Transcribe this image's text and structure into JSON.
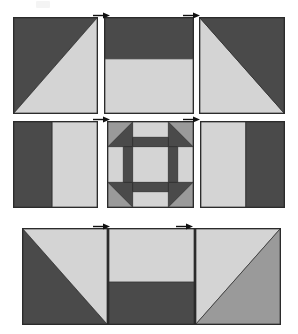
{
  "diagram": {
    "width": 298,
    "height": 334,
    "colors": {
      "dark": "#4a4a4a",
      "light": "#d4d4d4",
      "medium": "#9a9a9a",
      "outline": "#2b2b2b",
      "background": "#ffffff"
    },
    "faint_mark": {
      "x": 36,
      "y": 1,
      "w": 14,
      "h": 7,
      "color": "#f4f4f4"
    },
    "rows": [
      {
        "name": "row-1",
        "y": 17,
        "height": 97,
        "blocks": [
          {
            "name": "block-r1c1-half-square-triangle",
            "x": 13,
            "y": 17,
            "w": 85,
            "h": 97,
            "pattern": "hst-dark-upper-left",
            "pieces": [
              {
                "name": "dark-triangle",
                "fill": "dark",
                "points": "0,0 100,0 0,100"
              },
              {
                "name": "light-triangle",
                "fill": "light",
                "points": "100,0 100,100 0,100"
              }
            ]
          },
          {
            "name": "block-r1c2-half-rectangle",
            "x": 104,
            "y": 17,
            "w": 90,
            "h": 97,
            "pattern": "horizontal-split-dark-top",
            "pieces": [
              {
                "name": "dark-band-top",
                "fill": "dark",
                "points": "0,0 100,0 100,43 0,43"
              },
              {
                "name": "light-band-bottom",
                "fill": "light",
                "points": "0,43 100,43 100,100 0,100"
              }
            ]
          },
          {
            "name": "block-r1c3-half-square-triangle",
            "x": 199,
            "y": 17,
            "w": 86,
            "h": 97,
            "pattern": "hst-dark-upper-right",
            "pieces": [
              {
                "name": "light-triangle",
                "fill": "light",
                "points": "0,0 0,100 100,100"
              },
              {
                "name": "dark-triangle",
                "fill": "dark",
                "points": "0,0 100,0 100,100"
              }
            ]
          }
        ],
        "arrows": [
          {
            "name": "seam-arrow-r1-a",
            "x": 93,
            "y": 12,
            "direction": "right"
          },
          {
            "name": "seam-arrow-r1-b",
            "x": 183,
            "y": 12,
            "direction": "right"
          }
        ]
      },
      {
        "name": "row-2",
        "y": 121,
        "height": 87,
        "blocks": [
          {
            "name": "block-r2c1-two-bar",
            "x": 13,
            "y": 121,
            "w": 85,
            "h": 87,
            "pattern": "vertical-split-dark-left",
            "pieces": [
              {
                "name": "dark-bar-left",
                "fill": "dark",
                "points": "0,0 46,0 46,100 0,100"
              },
              {
                "name": "light-bar-right",
                "fill": "light",
                "points": "46,0 100,0 100,100 46,100"
              }
            ]
          },
          {
            "name": "block-r2c2-churn-dash-center",
            "x": 107,
            "y": 121,
            "w": 87,
            "h": 87,
            "pattern": "churn-dash",
            "pieces": [
              {
                "name": "background",
                "fill": "medium",
                "points": "0,0 100,0 100,100 0,100"
              },
              {
                "name": "corner-triangle-top-left",
                "fill": "dark",
                "points": "0,29 29,0 29,29"
              },
              {
                "name": "corner-triangle-top-right",
                "fill": "dark",
                "points": "71,0 100,29 71,29"
              },
              {
                "name": "corner-triangle-bottom-left",
                "fill": "dark",
                "points": "0,71 29,71 29,100"
              },
              {
                "name": "corner-triangle-bottom-right",
                "fill": "dark",
                "points": "71,71 100,71 71,100"
              },
              {
                "name": "bar-top-dark",
                "fill": "dark",
                "points": "29,18 71,18 71,29 29,29"
              },
              {
                "name": "bar-top-light",
                "fill": "light",
                "points": "29,0 71,0 71,18 29,18"
              },
              {
                "name": "bar-bottom-dark",
                "fill": "dark",
                "points": "29,71 71,71 71,82 29,82"
              },
              {
                "name": "bar-bottom-light",
                "fill": "light",
                "points": "29,82 71,82 71,100 29,100"
              },
              {
                "name": "bar-left-dark",
                "fill": "dark",
                "points": "18,29 29,29 29,71 18,71"
              },
              {
                "name": "bar-left-light",
                "fill": "light",
                "points": "0,29 18,29 18,71 0,71"
              },
              {
                "name": "bar-right-dark",
                "fill": "dark",
                "points": "71,29 82,29 82,71 71,71"
              },
              {
                "name": "bar-right-light",
                "fill": "light",
                "points": "82,29 100,29 100,71 82,71"
              },
              {
                "name": "center-square",
                "fill": "light",
                "points": "29,29 71,29 71,71 29,71"
              }
            ]
          },
          {
            "name": "block-r2c3-two-bar",
            "x": 200,
            "y": 121,
            "w": 85,
            "h": 87,
            "pattern": "vertical-split-light-left",
            "pieces": [
              {
                "name": "light-bar-left",
                "fill": "light",
                "points": "0,0 54,0 54,100 0,100"
              },
              {
                "name": "dark-bar-right",
                "fill": "dark",
                "points": "54,0 100,0 100,100 54,100"
              }
            ]
          }
        ],
        "arrows": [
          {
            "name": "seam-arrow-r2-a",
            "x": 93,
            "y": 116,
            "direction": "right"
          },
          {
            "name": "seam-arrow-r2-b",
            "x": 183,
            "y": 116,
            "direction": "right"
          }
        ]
      },
      {
        "name": "row-3",
        "y": 228,
        "height": 97,
        "blocks": [
          {
            "name": "block-r3c1-half-square-triangle",
            "x": 22,
            "y": 228,
            "w": 86,
            "h": 97,
            "pattern": "hst-light-upper-right",
            "pieces": [
              {
                "name": "dark-triangle",
                "fill": "dark",
                "points": "0,0 0,100 100,100"
              },
              {
                "name": "light-triangle",
                "fill": "light",
                "points": "0,0 100,0 100,100"
              }
            ]
          },
          {
            "name": "block-r3c2-half-rectangle",
            "x": 108,
            "y": 228,
            "w": 87,
            "h": 97,
            "pattern": "horizontal-split-light-top",
            "pieces": [
              {
                "name": "light-band-top",
                "fill": "light",
                "points": "0,0 100,0 100,56 0,56"
              },
              {
                "name": "dark-band-bottom",
                "fill": "dark",
                "points": "0,56 100,56 100,100 0,100"
              }
            ]
          },
          {
            "name": "block-r3c3-half-square-triangle",
            "x": 195,
            "y": 228,
            "w": 86,
            "h": 97,
            "pattern": "hst-medium-lower-right",
            "pieces": [
              {
                "name": "light-triangle",
                "fill": "light",
                "points": "0,0 0,100 100,0"
              },
              {
                "name": "medium-triangle",
                "fill": "medium",
                "points": "100,0 100,100 0,100"
              }
            ]
          }
        ],
        "arrows": [
          {
            "name": "seam-arrow-r3-a",
            "x": 93,
            "y": 223,
            "direction": "right"
          },
          {
            "name": "seam-arrow-r3-b",
            "x": 176,
            "y": 223,
            "direction": "right"
          }
        ]
      }
    ]
  }
}
